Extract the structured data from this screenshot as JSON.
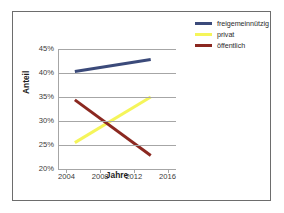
{
  "chart_data": {
    "type": "line",
    "title": "",
    "xlabel": "Jahre",
    "ylabel": "Anteil",
    "xlim": [
      2003,
      2017
    ],
    "ylim": [
      20,
      45
    ],
    "xticks": [
      "2004",
      "2008",
      "2012",
      "2016"
    ],
    "xtick_values": [
      2004,
      2008,
      2012,
      2016
    ],
    "yticks": [
      "20%",
      "25%",
      "30%",
      "35%",
      "40%",
      "45%"
    ],
    "ytick_values": [
      20,
      25,
      30,
      35,
      40,
      45
    ],
    "grid": true,
    "legend_position": "top-right",
    "x": [
      2005,
      2014
    ],
    "series": [
      {
        "name": "freigemeinnützig",
        "color": "#3b4a7a",
        "values": [
          40.3,
          42.8
        ]
      },
      {
        "name": "privat",
        "color": "#f5f55a",
        "values": [
          25.5,
          35.0
        ]
      },
      {
        "name": "öffentlich",
        "color": "#8b2820",
        "values": [
          34.4,
          22.8
        ]
      }
    ]
  },
  "legend": {
    "items": [
      {
        "label": "freigemeinnützig",
        "color": "#3b4a7a"
      },
      {
        "label": "privat",
        "color": "#f5f55a"
      },
      {
        "label": "öffentlich",
        "color": "#8b2820"
      }
    ]
  },
  "axes": {
    "x_title": "Jahre",
    "y_title": "Anteil"
  }
}
